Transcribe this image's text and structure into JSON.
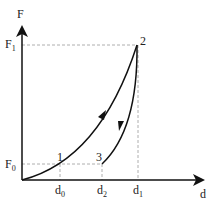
{
  "axes": {
    "y_label": "F",
    "x_label": "d"
  },
  "y_ticks": [
    {
      "main": "F",
      "sub": "1"
    },
    {
      "main": "F",
      "sub": "0"
    }
  ],
  "x_ticks": [
    {
      "main": "d",
      "sub": "0"
    },
    {
      "main": "d",
      "sub": "2"
    },
    {
      "main": "d",
      "sub": "1"
    }
  ],
  "points": [
    "1",
    "2",
    "3"
  ],
  "colors": {
    "line": "#111111",
    "dash": "#999999"
  }
}
